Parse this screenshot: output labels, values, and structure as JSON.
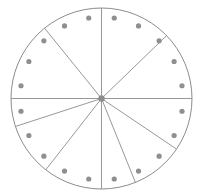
{
  "figure": {
    "name": "sectored-circle-with-perimeter-dots",
    "title": "",
    "canvas": {
      "width": 202,
      "height": 196,
      "background": "#ffffff"
    }
  },
  "circle": {
    "name": "outer-circle",
    "center_x": 101.5,
    "center_y": 98.5,
    "radius": 90.5,
    "stroke": "#8c8c8c",
    "stroke_width": 1,
    "fill": "#ffffff"
  },
  "hub": {
    "name": "center-hub",
    "x": 101.5,
    "y": 98.5,
    "radius": 3.2,
    "fill": "#8c8c8c"
  },
  "spokes": {
    "count": 10,
    "stroke": "#8c8c8c",
    "stroke_width": 0.9,
    "angles_deg": [
      0,
      46,
      90,
      124,
      158,
      180,
      218,
      252,
      270,
      321
    ],
    "labels": [
      "spoke-0",
      "spoke-46",
      "spoke-90",
      "spoke-124",
      "spoke-158",
      "spoke-180",
      "spoke-218",
      "spoke-252",
      "spoke-270",
      "spoke-321"
    ]
  },
  "dots": {
    "count": 20,
    "radius": 2.6,
    "fill": "#8f8f8f",
    "orbit_radius": 81.5,
    "start_angle_deg": 9,
    "step_deg": 18,
    "angles_deg": [
      9,
      27,
      45,
      63,
      81,
      99,
      117,
      135,
      153,
      171,
      189,
      207,
      225,
      243,
      261,
      279,
      297,
      315,
      333,
      351
    ]
  },
  "chart_data": {
    "type": "pie",
    "title": "",
    "categories": [
      "S1",
      "S2",
      "S3",
      "S4",
      "S5",
      "S6",
      "S7",
      "S8",
      "S9",
      "S10"
    ],
    "values": [
      46,
      44,
      34,
      34,
      22,
      38,
      34,
      18,
      51,
      39
    ],
    "units": "degrees",
    "legend": "none",
    "grid": false,
    "annotations": "20 marker dots spaced evenly every 18 degrees around the inner rim"
  }
}
